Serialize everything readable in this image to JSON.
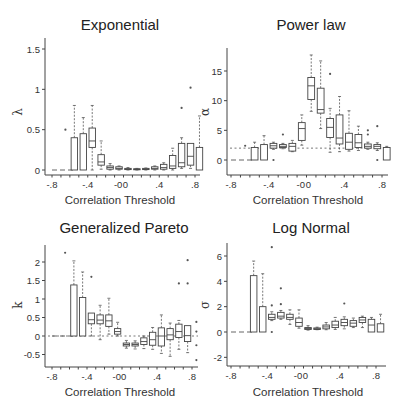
{
  "figure": {
    "width": 403,
    "height": 415
  },
  "chart_data": [
    {
      "type": "box",
      "title": "Exponential",
      "xlabel": "Correlation Threshold",
      "ylabel": "λ",
      "ylim": [
        -0.05,
        1.55
      ],
      "yticks": [
        0,
        0.5,
        1,
        1.5
      ],
      "ytick_labels": [
        "0",
        "0.5",
        "1",
        "1.5"
      ],
      "xticks": [
        -0.8,
        -0.4,
        -0.05,
        0,
        0.4,
        0.8
      ],
      "xtick_labels": [
        "-.8",
        "-.4",
        "-0",
        "0",
        ".4",
        ".8"
      ],
      "reference_line": null,
      "zero_dash_range": [
        -0.8,
        -0.55
      ],
      "x": [
        -0.6,
        -0.5,
        -0.4,
        -0.3,
        -0.2,
        -0.1,
        -0.05,
        0.0,
        0.1,
        0.2,
        0.3,
        0.4,
        0.5,
        0.6,
        0.7,
        0.8
      ],
      "boxes": [
        {
          "x": -0.6,
          "q1": 0,
          "med": 0,
          "q3": 0,
          "lo": 0,
          "hi": 0,
          "outliers": [
            0.5
          ]
        },
        {
          "x": -0.5,
          "q1": 0,
          "med": 0,
          "q3": 0.4,
          "lo": 0,
          "hi": 0.8,
          "outliers": []
        },
        {
          "x": -0.4,
          "q1": 0,
          "med": 0,
          "q3": 0.45,
          "lo": 0,
          "hi": 0.65,
          "outliers": []
        },
        {
          "x": -0.3,
          "q1": 0.28,
          "med": 0.36,
          "q3": 0.52,
          "lo": 0,
          "hi": 0.8,
          "outliers": []
        },
        {
          "x": -0.2,
          "q1": 0.06,
          "med": 0.1,
          "q3": 0.19,
          "lo": 0.01,
          "hi": 0.36,
          "outliers": []
        },
        {
          "x": -0.1,
          "q1": 0.01,
          "med": 0.03,
          "q3": 0.05,
          "lo": 0,
          "hi": 0.08,
          "outliers": []
        },
        {
          "x": 0.0,
          "q1": 0.01,
          "med": 0.02,
          "q3": 0.04,
          "lo": 0,
          "hi": 0.05,
          "outliers": []
        },
        {
          "x": 0.1,
          "q1": 0.005,
          "med": 0.01,
          "q3": 0.02,
          "lo": 0,
          "hi": 0.03,
          "outliers": []
        },
        {
          "x": 0.2,
          "q1": 0.005,
          "med": 0.01,
          "q3": 0.015,
          "lo": 0,
          "hi": 0.02,
          "outliers": []
        },
        {
          "x": 0.3,
          "q1": 0.005,
          "med": 0.01,
          "q3": 0.02,
          "lo": 0,
          "hi": 0.025,
          "outliers": []
        },
        {
          "x": 0.4,
          "q1": 0.01,
          "med": 0.02,
          "q3": 0.04,
          "lo": 0,
          "hi": 0.05,
          "outliers": []
        },
        {
          "x": 0.5,
          "q1": 0.01,
          "med": 0.03,
          "q3": 0.07,
          "lo": 0,
          "hi": 0.09,
          "outliers": []
        },
        {
          "x": 0.6,
          "q1": 0.02,
          "med": 0.05,
          "q3": 0.18,
          "lo": 0,
          "hi": 0.27,
          "outliers": []
        },
        {
          "x": 0.7,
          "q1": 0.04,
          "med": 0.09,
          "q3": 0.33,
          "lo": 0.02,
          "hi": 0.4,
          "outliers": [
            0.77
          ]
        },
        {
          "x": 0.8,
          "q1": 0.06,
          "med": 0.17,
          "q3": 0.33,
          "lo": 0.02,
          "hi": 0.33,
          "outliers": [
            1.02
          ]
        },
        {
          "x": 0.9,
          "q1": 0,
          "med": 0,
          "q3": 0.28,
          "lo": 0,
          "hi": 0.67,
          "outliers": []
        }
      ]
    },
    {
      "type": "box",
      "title": "Power law",
      "xlabel": "Correlation Threshold",
      "ylabel": "α",
      "ylim": [
        -2.2,
        18.5
      ],
      "yticks": [
        0,
        5,
        10,
        15
      ],
      "ytick_labels": [
        "0",
        "5",
        "10",
        "15"
      ],
      "xticks": [
        -0.8,
        -0.4,
        -0.05,
        0,
        0.4,
        0.8
      ],
      "xtick_labels": [
        "-.8",
        "-.4",
        "-0",
        "0",
        ".4",
        ".8"
      ],
      "reference_line": 2,
      "zero_dash_range": [
        -0.8,
        -0.55
      ],
      "boxes": [
        {
          "x": -0.6,
          "q1": 0,
          "med": 0,
          "q3": 0,
          "lo": 0,
          "hi": 0,
          "outliers": [
            2.4
          ]
        },
        {
          "x": -0.5,
          "q1": 0,
          "med": 0,
          "q3": 2.1,
          "lo": 0,
          "hi": 3,
          "outliers": []
        },
        {
          "x": -0.4,
          "q1": 0,
          "med": 0,
          "q3": 2.6,
          "lo": 0,
          "hi": 4.1,
          "outliers": []
        },
        {
          "x": -0.3,
          "q1": 2.0,
          "med": 2.4,
          "q3": 2.8,
          "lo": 1.8,
          "hi": 3,
          "outliers": [
            0
          ]
        },
        {
          "x": -0.2,
          "q1": 2.1,
          "med": 2.3,
          "q3": 2.6,
          "lo": 1.9,
          "hi": 2.8,
          "outliers": [
            4.3
          ]
        },
        {
          "x": -0.1,
          "q1": 1.5,
          "med": 2.3,
          "q3": 2.8,
          "lo": 1.4,
          "hi": 3.3,
          "outliers": []
        },
        {
          "x": 0.0,
          "q1": 3.3,
          "med": 5.3,
          "q3": 6.3,
          "lo": 2.5,
          "hi": 7.6,
          "outliers": []
        },
        {
          "x": 0.1,
          "q1": 10.2,
          "med": 12.5,
          "q3": 13.9,
          "lo": 8.2,
          "hi": 17.7,
          "outliers": []
        },
        {
          "x": 0.2,
          "q1": 7.9,
          "med": 8.5,
          "q3": 12.1,
          "lo": 5.3,
          "hi": 16.7,
          "outliers": []
        },
        {
          "x": 0.3,
          "q1": 3.8,
          "med": 5.5,
          "q3": 7.0,
          "lo": 1.3,
          "hi": 8.7,
          "outliers": [
            14.5
          ]
        },
        {
          "x": 0.4,
          "q1": 2.7,
          "med": 3.7,
          "q3": 7.6,
          "lo": 1.4,
          "hi": 10.7,
          "outliers": []
        },
        {
          "x": 0.5,
          "q1": 1.8,
          "med": 3.0,
          "q3": 4.5,
          "lo": 1.5,
          "hi": 8.3,
          "outliers": []
        },
        {
          "x": 0.6,
          "q1": 2.1,
          "med": 2.9,
          "q3": 4.3,
          "lo": 1.6,
          "hi": 5.7,
          "outliers": []
        },
        {
          "x": 0.7,
          "q1": 2.0,
          "med": 2.3,
          "q3": 2.7,
          "lo": 1.8,
          "hi": 3.0,
          "outliers": [
            4.3,
            5.0
          ]
        },
        {
          "x": 0.8,
          "q1": 1.9,
          "med": 2.3,
          "q3": 2.6,
          "lo": 1.6,
          "hi": 2.9,
          "outliers": [
            5.7,
            0
          ]
        },
        {
          "x": 0.9,
          "q1": 0,
          "med": 0,
          "q3": 2.1,
          "lo": 0,
          "hi": 2.3,
          "outliers": []
        }
      ]
    },
    {
      "type": "box",
      "title": "Generalized Pareto",
      "xlabel": "Correlation Threshold",
      "ylabel": "k",
      "ylim": [
        -0.8,
        2.4
      ],
      "yticks": [
        -0.5,
        0,
        0.5,
        1,
        1.5,
        2
      ],
      "ytick_labels": [
        "-0.5",
        "0",
        "0.5",
        "1",
        "1.5",
        "2"
      ],
      "xticks": [
        -0.8,
        -0.4,
        -0.05,
        0,
        0.4,
        0.8
      ],
      "xtick_labels": [
        "-.8",
        "-.4",
        "-0",
        "0",
        ".4",
        ".8"
      ],
      "reference_line": 0,
      "zero_dash_range": [
        -0.8,
        -0.55
      ],
      "boxes": [
        {
          "x": -0.6,
          "q1": 0,
          "med": 0,
          "q3": 0,
          "lo": 0,
          "hi": 0,
          "outliers": [
            2.25
          ]
        },
        {
          "x": -0.5,
          "q1": 0,
          "med": 0,
          "q3": 1.38,
          "lo": 0,
          "hi": 2.03,
          "outliers": []
        },
        {
          "x": -0.4,
          "q1": 0,
          "med": 0,
          "q3": 1.04,
          "lo": 0,
          "hi": 1.73,
          "outliers": []
        },
        {
          "x": -0.3,
          "q1": 0.33,
          "med": 0.44,
          "q3": 0.62,
          "lo": 0,
          "hi": 0.62,
          "outliers": [
            1.6
          ]
        },
        {
          "x": -0.2,
          "q1": 0.33,
          "med": 0.43,
          "q3": 0.57,
          "lo": -0.1,
          "hi": 0.83,
          "outliers": []
        },
        {
          "x": -0.1,
          "q1": 0.26,
          "med": 0.41,
          "q3": 0.57,
          "lo": 0.05,
          "hi": 1.02,
          "outliers": []
        },
        {
          "x": 0.0,
          "q1": 0.05,
          "med": 0.12,
          "q3": 0.2,
          "lo": 0,
          "hi": 0.37,
          "outliers": []
        },
        {
          "x": 0.1,
          "q1": -0.27,
          "med": -0.23,
          "q3": -0.19,
          "lo": -0.33,
          "hi": -0.12,
          "outliers": []
        },
        {
          "x": 0.2,
          "q1": -0.27,
          "med": -0.23,
          "q3": -0.19,
          "lo": -0.35,
          "hi": -0.13,
          "outliers": []
        },
        {
          "x": 0.3,
          "q1": -0.23,
          "med": -0.15,
          "q3": -0.05,
          "lo": -0.34,
          "hi": 0,
          "outliers": []
        },
        {
          "x": 0.4,
          "q1": -0.25,
          "med": -0.1,
          "q3": 0.1,
          "lo": -0.36,
          "hi": 0.23,
          "outliers": []
        },
        {
          "x": 0.5,
          "q1": -0.27,
          "med": 0.0,
          "q3": 0.22,
          "lo": -0.47,
          "hi": 0.57,
          "outliers": []
        },
        {
          "x": 0.6,
          "q1": -0.1,
          "med": 0.03,
          "q3": 0.2,
          "lo": -0.55,
          "hi": 0.35,
          "outliers": []
        },
        {
          "x": 0.7,
          "q1": -0.04,
          "med": 0.12,
          "q3": 0.32,
          "lo": -0.36,
          "hi": 0.42,
          "outliers": [
            1.42
          ]
        },
        {
          "x": 0.8,
          "q1": -0.15,
          "med": 0.01,
          "q3": 0.28,
          "lo": -0.45,
          "hi": 0.28,
          "outliers": [
            2.05,
            1.42
          ]
        },
        {
          "x": 0.9,
          "q1": 0,
          "med": 0,
          "q3": 0,
          "lo": 0,
          "hi": 0,
          "outliers": [
            0.38,
            0.12,
            -0.25,
            -0.65
          ]
        }
      ]
    },
    {
      "type": "box",
      "title": "Log Normal",
      "xlabel": "Correlation Threshold",
      "ylabel": "σ",
      "ylim": [
        -2.7,
        7.1
      ],
      "yticks": [
        -2,
        0,
        2,
        4,
        6
      ],
      "ytick_labels": [
        "-2",
        "0",
        "2",
        "4",
        "6"
      ],
      "xticks": [
        -0.8,
        -0.4,
        -0.05,
        0,
        0.4,
        0.8
      ],
      "xtick_labels": [
        "-.8",
        "-.4",
        "-0",
        "0",
        ".4",
        ".8"
      ],
      "reference_line": null,
      "zero_dash_range": [
        -0.8,
        -0.55
      ],
      "boxes": [
        {
          "x": -0.5,
          "q1": 0,
          "med": 0,
          "q3": 4.45,
          "lo": 0,
          "hi": 5.6,
          "outliers": []
        },
        {
          "x": -0.4,
          "q1": 0,
          "med": 0,
          "q3": 2.0,
          "lo": 0,
          "hi": 4.6,
          "outliers": []
        },
        {
          "x": -0.3,
          "q1": 1.0,
          "med": 1.15,
          "q3": 1.4,
          "lo": 0.9,
          "hi": 1.6,
          "outliers": [
            6.7,
            2.1,
            0
          ]
        },
        {
          "x": -0.2,
          "q1": 1.1,
          "med": 1.25,
          "q3": 1.55,
          "lo": 1.0,
          "hi": 1.7,
          "outliers": [
            3.45,
            2.2
          ]
        },
        {
          "x": -0.1,
          "q1": 1.0,
          "med": 1.15,
          "q3": 1.4,
          "lo": 0.6,
          "hi": 1.75,
          "outliers": []
        },
        {
          "x": 0.0,
          "q1": 0.45,
          "med": 0.75,
          "q3": 1.1,
          "lo": 0.3,
          "hi": 1.75,
          "outliers": []
        },
        {
          "x": 0.1,
          "q1": 0.2,
          "med": 0.28,
          "q3": 0.35,
          "lo": 0.15,
          "hi": 0.5,
          "outliers": []
        },
        {
          "x": 0.2,
          "q1": 0.2,
          "med": 0.26,
          "q3": 0.32,
          "lo": 0.18,
          "hi": 0.38,
          "outliers": []
        },
        {
          "x": 0.3,
          "q1": 0.25,
          "med": 0.4,
          "q3": 0.55,
          "lo": 0.18,
          "hi": 0.75,
          "outliers": []
        },
        {
          "x": 0.4,
          "q1": 0.35,
          "med": 0.55,
          "q3": 0.85,
          "lo": 0.2,
          "hi": 1.15,
          "outliers": []
        },
        {
          "x": 0.5,
          "q1": 0.5,
          "med": 0.75,
          "q3": 1.0,
          "lo": 0.25,
          "hi": 1.2,
          "outliers": [
            2.25
          ]
        },
        {
          "x": 0.6,
          "q1": 0.45,
          "med": 0.7,
          "q3": 0.9,
          "lo": 0.35,
          "hi": 1.1,
          "outliers": []
        },
        {
          "x": 0.7,
          "q1": 0.75,
          "med": 0.95,
          "q3": 1.15,
          "lo": 0.35,
          "hi": 1.25,
          "outliers": []
        },
        {
          "x": 0.8,
          "q1": 0,
          "med": 0.55,
          "q3": 1.0,
          "lo": 0,
          "hi": 1.15,
          "outliers": []
        },
        {
          "x": 0.9,
          "q1": 0,
          "med": 0,
          "q3": 0.65,
          "lo": 0,
          "hi": 1.4,
          "outliers": []
        }
      ]
    }
  ]
}
